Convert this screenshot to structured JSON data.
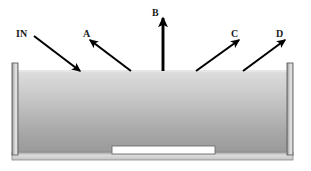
{
  "figure": {
    "name": "light-ray-tank-diagram",
    "background_color": "#ffffff"
  },
  "tank": {
    "name": "liquid-tank",
    "wall_color": "#a8a8a8",
    "wall_highlight_color": "#e2e2e2",
    "wall_outline_color": "#5a5a5a",
    "base_color": "#d0d0d0",
    "base_outline_color": "#8a8a8a",
    "left_wall_x": 12,
    "right_wall_x": 293,
    "top_y": 63,
    "bottom_y": 160
  },
  "liquid": {
    "name": "liquid-body",
    "surface_y": 70,
    "bottom_y": 152,
    "gradient_top_color": "#dcdcdc",
    "gradient_mid_color": "#bdbdbd",
    "gradient_bottom_color": "#9a9a9a"
  },
  "submerged_object": {
    "name": "submerged-white-block",
    "fill_color": "#ffffff",
    "outline_color": "#6e6e6e",
    "x": 112,
    "y": 146,
    "width": 103,
    "height": 8
  },
  "rays": [
    {
      "id": "in",
      "label": "IN",
      "label_x": 16,
      "label_y": 37,
      "direction": "incoming-down-right",
      "x1": 34,
      "y1": 36,
      "x2": 80,
      "y2": 71,
      "stroke_width": 2.1,
      "color": "#000000"
    },
    {
      "id": "a",
      "label": "A",
      "label_x": 83,
      "label_y": 37,
      "direction": "outgoing-up-left",
      "x1": 131,
      "y1": 71,
      "x2": 90,
      "y2": 40,
      "stroke_width": 2.1,
      "color": "#000000"
    },
    {
      "id": "b",
      "label": "B",
      "label_x": 152,
      "label_y": 16,
      "direction": "outgoing-up-vertical",
      "x1": 163,
      "y1": 71,
      "x2": 163,
      "y2": 18,
      "stroke_width": 2.8,
      "color": "#000000"
    },
    {
      "id": "c",
      "label": "C",
      "label_x": 231,
      "label_y": 37,
      "direction": "outgoing-up-right",
      "x1": 196,
      "y1": 71,
      "x2": 239,
      "y2": 40,
      "stroke_width": 2.1,
      "color": "#000000"
    },
    {
      "id": "d",
      "label": "D",
      "label_x": 276,
      "label_y": 37,
      "direction": "outgoing-up-right",
      "x1": 243,
      "y1": 71,
      "x2": 285,
      "y2": 40,
      "stroke_width": 2.1,
      "color": "#000000"
    }
  ]
}
